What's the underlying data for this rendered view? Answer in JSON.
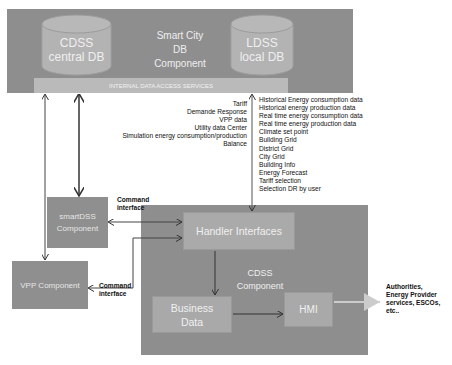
{
  "colors": {
    "container": "#8e8e8e",
    "cylinder": "#b3b3b3",
    "access_bar": "#bababa",
    "inner_box": "#a9a9a9",
    "side_box": "#8f8f8f",
    "arrow": "#333333",
    "hmi_arrow": "#cccccc"
  },
  "smart_city_db": {
    "title_lines": [
      "Smart City",
      "DB",
      "Component"
    ],
    "cdss_db": [
      "CDSS",
      "central DB"
    ],
    "ldss_db": [
      "LDSS",
      "local DB"
    ],
    "access_bar": "INTERNAL DATA ACCESS SERVICES"
  },
  "left_data_labels": [
    "Tariff",
    "Demande Response",
    "VPP data",
    "Utility data Center",
    "Simulation energy consumption/production",
    "Balance"
  ],
  "right_data_labels": [
    "Historical Energy consumption data",
    "Historical energy production data",
    "Real time energy consumption data",
    "Real time energy production data",
    "Climate set point",
    "Building Grid",
    "District Grid",
    "City Grid",
    "Building Info",
    "Energy Forecast",
    "Tariff selection",
    "Selection DR by user"
  ],
  "smartdss": {
    "lines": [
      "smartDSS",
      "Component"
    ],
    "command_label": [
      "Command",
      "interface"
    ]
  },
  "vpp": {
    "label": "VPP Component",
    "command_label": [
      "Command",
      "interface"
    ]
  },
  "cdss_component": {
    "title_lines": [
      "CDSS",
      "Component"
    ],
    "handler": "Handler Interfaces",
    "business_data": [
      "Business",
      "Data"
    ],
    "hmi": "HMI"
  },
  "external_actors": [
    "Authorities,",
    "Energy Provider",
    "services, ESCOs,",
    "etc.."
  ]
}
